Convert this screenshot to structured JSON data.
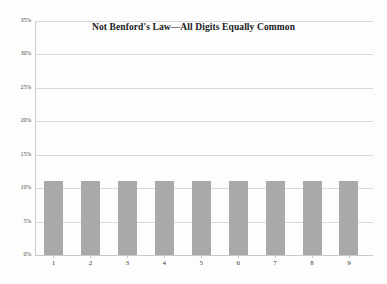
{
  "chart_data": {
    "type": "bar",
    "title": "Not Benford's Law—All Digits Equally Common",
    "xlabel": "",
    "ylabel": "",
    "categories": [
      "1",
      "2",
      "3",
      "4",
      "5",
      "6",
      "7",
      "8",
      "9"
    ],
    "values": [
      11.1,
      11.1,
      11.1,
      11.1,
      11.1,
      11.1,
      11.1,
      11.1,
      11.1
    ],
    "ylim": [
      0,
      35
    ],
    "ytick_values": [
      35,
      30,
      25,
      20,
      15,
      10,
      5,
      0
    ],
    "ytick_labels": [
      "35%",
      "30%",
      "25%",
      "20%",
      "15%",
      "10%",
      "5%",
      "0%"
    ],
    "grid": true,
    "legend": false,
    "bar_color": "#a9a9a9",
    "gridline_color": "#d9d9d9",
    "axis_color": "#c9c9c9",
    "background_color": "#fdfdfd"
  }
}
